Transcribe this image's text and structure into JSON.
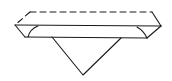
{
  "diagram": {
    "type": "line-drawing",
    "colors": {
      "line": "#1a1a1a",
      "background": "#ffffff"
    },
    "hidden_edges": {
      "style": "dashed",
      "top_back": [
        [
          30,
          12
        ],
        [
          152,
          12
        ]
      ],
      "left_back": [
        [
          30,
          12
        ],
        [
          15,
          25
        ]
      ]
    },
    "visible_edges": {
      "right_back": [
        [
          152,
          12
        ],
        [
          161,
          26
        ]
      ],
      "front_top": [
        [
          15,
          25
        ],
        [
          161,
          26
        ]
      ],
      "left_flap_outer": [
        [
          15,
          25
        ],
        [
          25,
          37
        ]
      ],
      "left_flap_inner": [
        [
          38,
          26
        ],
        [
          28,
          37
        ]
      ],
      "right_flap_outer": [
        [
          161,
          26
        ],
        [
          147,
          38
        ]
      ],
      "right_flap_inner": [
        [
          137,
          27
        ],
        [
          147,
          38
        ]
      ],
      "bottom": [
        [
          25,
          37
        ],
        [
          147,
          38
        ]
      ]
    },
    "triangle": {
      "points": [
        [
          52,
          37
        ],
        [
          121,
          38
        ],
        [
          83,
          75
        ]
      ]
    }
  }
}
